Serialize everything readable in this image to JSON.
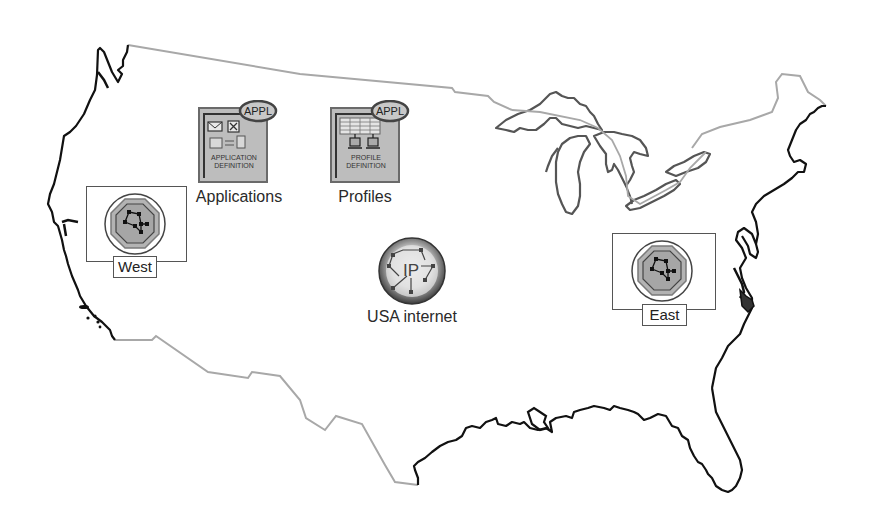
{
  "diagram": {
    "colors": {
      "coastline": "#111111",
      "border": "#a8a8a8",
      "lakes": "#555555",
      "icon_fill": "#b9b9b9",
      "icon_dark": "#6e6e6e",
      "badge_fill": "#bdbdbd"
    },
    "nodes": {
      "applications": {
        "label": "Applications",
        "icon": "application-definition-icon",
        "badge": "APPL",
        "caption_line1": "APPLICATION",
        "caption_line2": "DEFINITION"
      },
      "profiles": {
        "label": "Profiles",
        "icon": "profile-definition-icon",
        "badge": "APPL",
        "caption_line1": "PROFILE",
        "caption_line2": "DEFINITION"
      },
      "west": {
        "label": "West",
        "icon": "network-server-icon"
      },
      "east": {
        "label": "East",
        "icon": "network-server-icon"
      },
      "internet": {
        "label": "USA internet",
        "icon": "ip-network-globe-icon",
        "icon_text": "IP"
      }
    }
  }
}
